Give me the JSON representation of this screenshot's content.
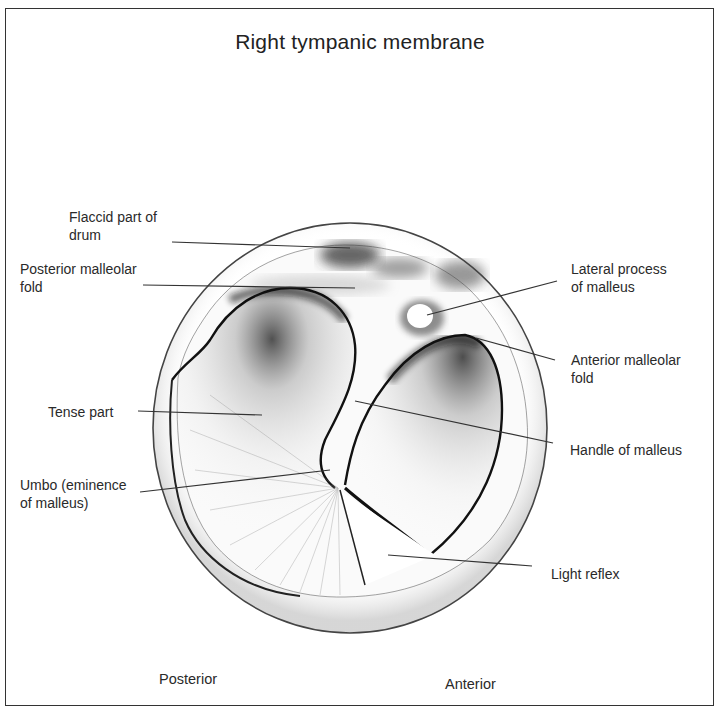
{
  "figure": {
    "title": "Right tympanic membrane",
    "orientation": {
      "left": "Posterior",
      "right": "Anterior"
    },
    "labels": {
      "flaccid_part": "Flaccid part of\ndrum",
      "posterior_malleolar_fold": "Posterior malleolar\nfold",
      "tense_part": "Tense part",
      "umbo": "Umbo (eminence\nof malleus)",
      "lateral_process": "Lateral process\nof malleus",
      "anterior_malleolar_fold": "Anterior malleolar\nfold",
      "handle_of_malleus": "Handle of malleus",
      "light_reflex": "Light reflex"
    },
    "colors": {
      "ink": "#222222",
      "line": "#333333",
      "background": "#ffffff"
    }
  }
}
